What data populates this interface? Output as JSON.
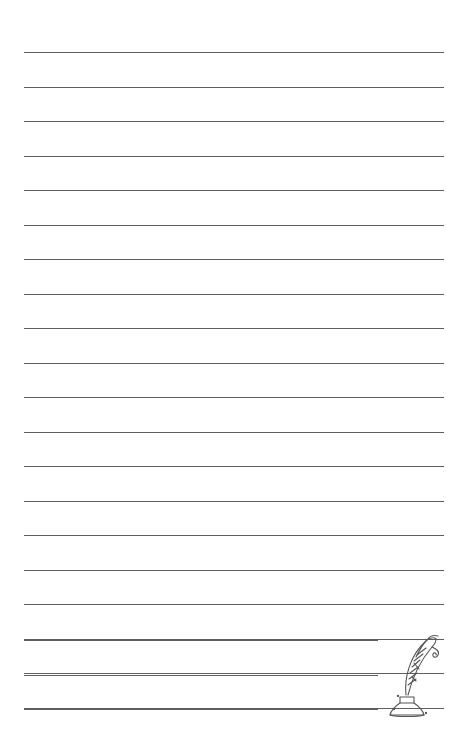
{
  "page": {
    "type": "lined-writing-paper",
    "background_color": "#ffffff",
    "line_color": "#5e5e5e",
    "line_spacing_px": 34.5,
    "full_lines": {
      "count": 21,
      "first_y": 52,
      "x_start": 24,
      "x_end": 444
    },
    "short_lines": {
      "count": 3,
      "first_y": 640,
      "x_start": 24,
      "x_end": 378
    }
  },
  "illustration": {
    "icon": "quill-and-inkwell-icon"
  }
}
